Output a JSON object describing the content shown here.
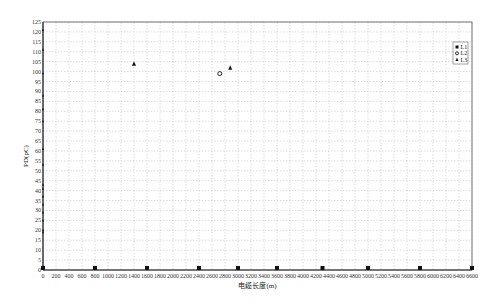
{
  "chart_data": {
    "type": "scatter",
    "title": "",
    "xlabel": "电缆长度(m)",
    "ylabel": "PD(pC)",
    "xlim": [
      0,
      6600
    ],
    "ylim": [
      0,
      125
    ],
    "x_ticks": [
      0,
      200,
      400,
      600,
      800,
      1000,
      1200,
      1400,
      1600,
      1800,
      2000,
      2200,
      2400,
      2600,
      2800,
      3000,
      3200,
      3400,
      3600,
      3800,
      4000,
      4200,
      4400,
      4600,
      4800,
      5000,
      5200,
      5400,
      5600,
      5800,
      6000,
      6200,
      6400,
      6600
    ],
    "y_ticks": [
      0,
      5,
      10,
      15,
      20,
      25,
      30,
      35,
      40,
      45,
      50,
      55,
      60,
      65,
      70,
      75,
      80,
      85,
      90,
      95,
      100,
      105,
      110,
      115,
      120,
      125
    ],
    "grid": true,
    "legend_position": "upper right",
    "series": [
      {
        "name": "L1",
        "marker": "square",
        "points": [
          [
            0,
            1
          ],
          [
            800,
            1
          ],
          [
            1600,
            1
          ],
          [
            2400,
            1
          ],
          [
            3000,
            1
          ],
          [
            3600,
            1
          ],
          [
            4300,
            1
          ],
          [
            5000,
            1
          ],
          [
            5800,
            1
          ],
          [
            6600,
            1
          ]
        ]
      },
      {
        "name": "L2",
        "marker": "circle",
        "points": [
          [
            2720,
            99
          ]
        ]
      },
      {
        "name": "L3",
        "marker": "triangle",
        "points": [
          [
            1400,
            104
          ],
          [
            2880,
            102
          ],
          [
            0,
            121
          ],
          [
            0,
            111
          ],
          [
            0,
            99
          ],
          [
            0,
            88
          ],
          [
            0,
            81
          ],
          [
            0,
            75
          ],
          [
            0,
            61
          ],
          [
            0,
            53
          ],
          [
            0,
            43
          ],
          [
            0,
            41
          ],
          [
            0,
            37
          ],
          [
            0,
            33
          ],
          [
            0,
            29
          ],
          [
            0,
            25
          ],
          [
            0,
            20
          ],
          [
            0,
            19
          ]
        ]
      }
    ]
  },
  "legend": {
    "items": [
      {
        "label": "L1",
        "marker": "square"
      },
      {
        "label": "L2",
        "marker": "circle"
      },
      {
        "label": "L3",
        "marker": "triangle"
      }
    ]
  },
  "axes": {
    "xlabel": "电缆长度(m)",
    "ylabel": "PD(pC)"
  },
  "colors": {
    "marker": "#111111",
    "grid": "#bdbdbd",
    "axis": "#333333"
  }
}
